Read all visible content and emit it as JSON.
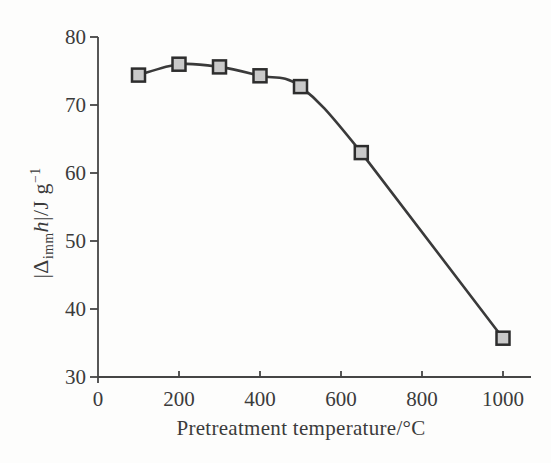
{
  "figure": {
    "background": "#fdfdfc"
  },
  "chart_data": {
    "type": "line",
    "title": "",
    "xlabel": "Pretreatment temperature/°C",
    "ylabel": "|Δimm h|/J g−1",
    "ylabel_parts": {
      "open_bar_delta": "|Δ",
      "subscript": "imm",
      "variable": "h",
      "close_bar_units": "|/J g",
      "exponent": "−1"
    },
    "series": [
      {
        "name": "immersion-enthalpy-vs-pretreatment-temperature",
        "x": [
          100,
          200,
          300,
          400,
          500,
          650,
          1000
        ],
        "y": [
          74.4,
          76.0,
          75.6,
          74.3,
          72.7,
          63.0,
          35.7
        ]
      }
    ],
    "xlim": [
      0,
      1070
    ],
    "ylim": [
      30,
      80
    ],
    "x_ticks": [
      0,
      200,
      400,
      600,
      800,
      1000
    ],
    "y_ticks": [
      30,
      40,
      50,
      60,
      70,
      80
    ],
    "grid": false,
    "legend": false,
    "marker": "square",
    "colors": {
      "line": "#3a3a3a",
      "marker_fill": "#c9c9c9",
      "marker_edge": "#2d2d2d",
      "axis": "#454545",
      "text": "#3b3b3b"
    }
  }
}
